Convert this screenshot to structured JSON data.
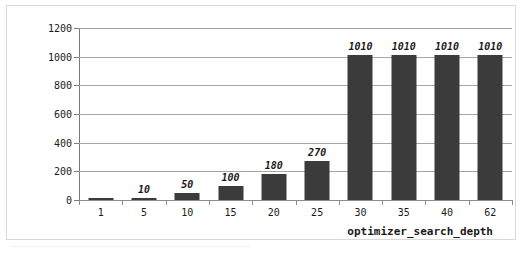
{
  "chart_data": {
    "type": "bar",
    "title": "",
    "subtitle": "",
    "xlabel": "optimizer_search_depth",
    "ylabel": "Elapsed MilliSeconds",
    "categories": [
      "1",
      "5",
      "10",
      "15",
      "20",
      "25",
      "30",
      "35",
      "40",
      "62"
    ],
    "values": [
      5,
      10,
      50,
      100,
      180,
      270,
      1010,
      1010,
      1010,
      1010
    ],
    "data_labels": [
      "",
      "10",
      "50",
      "100",
      "180",
      "270",
      "1010",
      "1010",
      "1010",
      "1010"
    ],
    "ylim": [
      0,
      1200
    ],
    "ytick_labels": [
      "0",
      "200",
      "400",
      "600",
      "800",
      "1000",
      "1200"
    ],
    "ytick_values": [
      0,
      200,
      400,
      600,
      800,
      1000,
      1200
    ],
    "grid": true,
    "legend": false,
    "legend_position": "none",
    "series": [
      {
        "name": "Elapsed MilliSeconds",
        "values": [
          5,
          10,
          50,
          100,
          180,
          270,
          1010,
          1010,
          1010,
          1010
        ]
      }
    ]
  },
  "style": {
    "bar_color": "#3b3b3b",
    "grid_color": "#a6a6a6",
    "axis_color": "#8c8c8c",
    "text_color": "#1a1a1a",
    "frame_color": "#d9d9d9",
    "background": "#ffffff"
  }
}
